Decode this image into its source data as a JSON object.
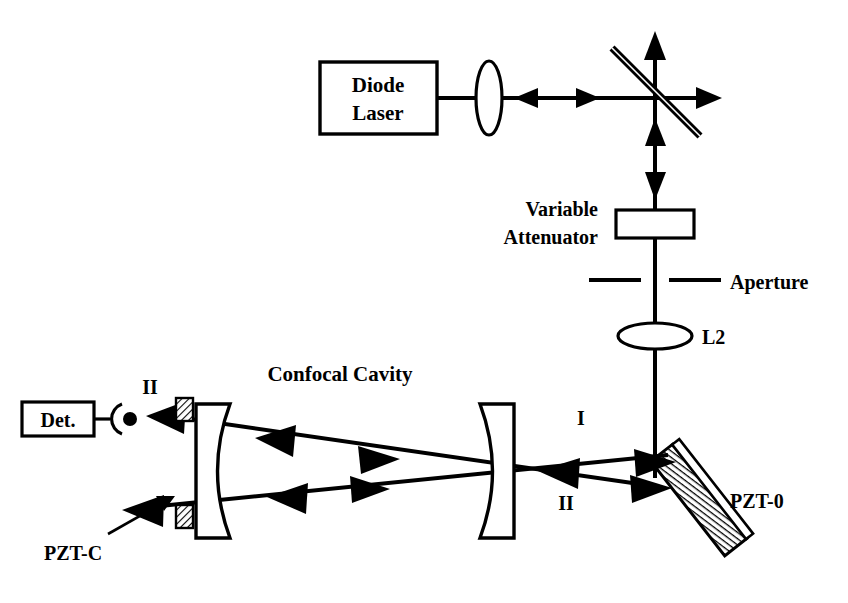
{
  "figure": {
    "kind": "optical-setup-diagram",
    "width": 848,
    "height": 603,
    "background_color": "#ffffff",
    "ink_color": "#000000"
  },
  "labels": {
    "diode_laser_line1": "Diode",
    "diode_laser_line2": "Laser",
    "variable_attenuator_line1": "Variable",
    "variable_attenuator_line2": "Attenuator",
    "aperture": "Aperture",
    "lens_l2": "L2",
    "confocal_cavity": "Confocal Cavity",
    "detector": "Det.",
    "pzt_c": "PZT-C",
    "pzt_0": "PZT-0",
    "beam_i": "I",
    "beam_ii_right": "II",
    "beam_ii_left": "II"
  },
  "components": [
    {
      "id": "diode-laser",
      "name": "Diode Laser",
      "type": "source-box",
      "x": 320,
      "y": 62,
      "w": 117,
      "h": 72
    },
    {
      "id": "lens-l1",
      "name": "Collimating lens L1",
      "type": "lens-vertical",
      "cx": 489,
      "cy": 98,
      "rx": 13,
      "ry": 37
    },
    {
      "id": "beam-splitter",
      "name": "Beam splitter",
      "type": "diagonal-plate",
      "x1": 612,
      "y1": 48,
      "x2": 700,
      "y2": 136
    },
    {
      "id": "variable-attenuator",
      "name": "Variable Attenuator",
      "type": "rect-plate",
      "x": 616,
      "y": 210,
      "w": 78,
      "h": 28
    },
    {
      "id": "aperture",
      "name": "Aperture",
      "type": "slit-pair",
      "y": 280,
      "left_x1": 589,
      "left_x2": 641,
      "right_x1": 669,
      "right_x2": 721
    },
    {
      "id": "lens-l2",
      "name": "Lens L2",
      "type": "lens-horizontal",
      "cx": 655,
      "cy": 336,
      "rx": 37,
      "ry": 13
    },
    {
      "id": "pzt-0-mirror",
      "name": "PZT-0 steering mirror",
      "type": "hatched-plate",
      "cx": 683,
      "cy": 478,
      "angle_deg": 52
    },
    {
      "id": "cavity-mirror-right",
      "name": "Right cavity mirror",
      "type": "meniscus-right",
      "x": 480,
      "y": 404,
      "h": 134
    },
    {
      "id": "cavity-mirror-left",
      "name": "Left cavity mirror",
      "type": "meniscus-left",
      "x": 196,
      "y": 404,
      "h": 134
    },
    {
      "id": "pzt-c-top",
      "name": "PZT-C top block",
      "type": "hatched-block",
      "x": 176,
      "y": 398,
      "w": 17,
      "h": 22
    },
    {
      "id": "pzt-c-bottom",
      "name": "PZT-C bottom block",
      "type": "hatched-block",
      "x": 176,
      "y": 506,
      "w": 17,
      "h": 22
    },
    {
      "id": "detector",
      "name": "Detector Det.",
      "type": "detector-box",
      "x": 22,
      "y": 402,
      "w": 72,
      "h": 34
    }
  ],
  "beam_paths": [
    {
      "id": "laser-to-splitter",
      "name": "Laser output to beam splitter",
      "from": "diode-laser",
      "to": "beam-splitter",
      "direction": "right",
      "arrows": [
        "right-at-540",
        "left-at-575"
      ]
    },
    {
      "id": "splitter-up",
      "name": "Beam splitter upward port",
      "direction": "up",
      "arrow": "up"
    },
    {
      "id": "splitter-right",
      "name": "Beam splitter right port",
      "direction": "right",
      "arrow": "right"
    },
    {
      "id": "splitter-down",
      "name": "Beam splitter to attenuator",
      "direction": "down",
      "arrows": [
        "up-at-150",
        "down-at-195"
      ]
    },
    {
      "id": "down-to-pzt0",
      "name": "Vertical beam down to PZT-0",
      "direction": "down"
    },
    {
      "id": "pzt0-to-cavity-I",
      "name": "Beam I from PZT-0 into cavity",
      "direction": "left"
    },
    {
      "id": "cavity-to-pzt0-II",
      "name": "Beam II returning to PZT-0",
      "direction": "right"
    },
    {
      "id": "cavity-to-detector",
      "name": "Cavity output to detector",
      "direction": "left"
    }
  ]
}
